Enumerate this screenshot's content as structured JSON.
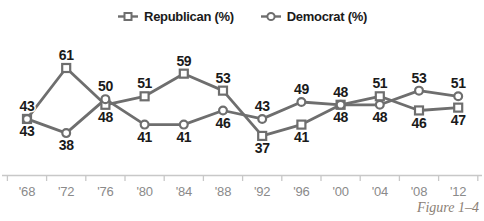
{
  "legend": {
    "republican": {
      "label": "Republican (%)",
      "marker": "square"
    },
    "democrat": {
      "label": "Democrat (%)",
      "marker": "circle"
    }
  },
  "caption": "Figure 1–4",
  "colors": {
    "line": "#6e6e6e",
    "marker_fill": "#ffffff",
    "data_label": "#1a1a1a",
    "axis": "#c8c8c8",
    "axis_label": "#8a8a8a",
    "caption": "#8c8176"
  },
  "chart_data": {
    "type": "line",
    "title": "",
    "xlabel": "",
    "ylabel": "",
    "categories": [
      "'68",
      "'72",
      "'76",
      "'80",
      "'84",
      "'88",
      "'92",
      "'96",
      "'00",
      "'04",
      "'08",
      "'12"
    ],
    "series": [
      {
        "name": "Republican (%)",
        "marker": "square",
        "values": [
          43,
          61,
          48,
          51,
          59,
          53,
          37,
          41,
          48,
          51,
          46,
          47
        ],
        "label_position": [
          "above",
          "above",
          "below",
          "above",
          "above",
          "above",
          "below",
          "below",
          "above",
          "above",
          "below",
          "below"
        ]
      },
      {
        "name": "Democrat (%)",
        "marker": "circle",
        "values": [
          43,
          38,
          50,
          41,
          41,
          46,
          43,
          49,
          48,
          48,
          53,
          51
        ],
        "label_position": [
          "below",
          "below",
          "above",
          "below",
          "below",
          "below",
          "above",
          "above",
          "below",
          "below",
          "above",
          "above"
        ]
      }
    ],
    "ylim": [
      33,
      66
    ],
    "grid": false,
    "legend_position": "top",
    "data_labels": true
  }
}
